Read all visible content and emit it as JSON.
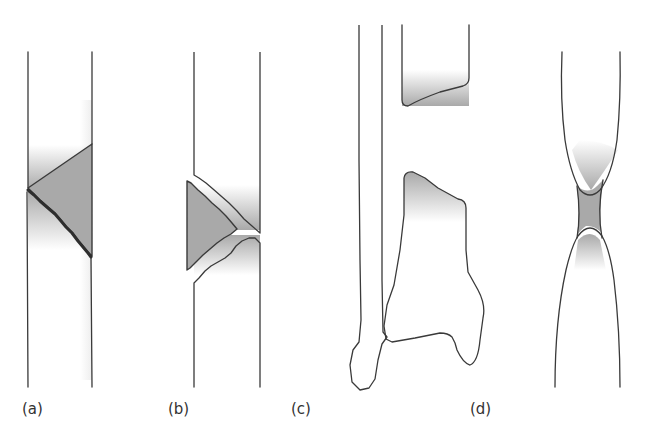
{
  "figure": {
    "panels": [
      {
        "id": "a",
        "label": "(a)"
      },
      {
        "id": "b",
        "label": "(b)"
      },
      {
        "id": "c",
        "label": "(c)"
      },
      {
        "id": "d",
        "label": "(d)"
      }
    ]
  },
  "colors": {
    "line": "#3a3a3a",
    "fragment_fill": "#a9a9a9",
    "shade": "#8c8c8c",
    "background": "#ffffff",
    "label": "#333333"
  }
}
